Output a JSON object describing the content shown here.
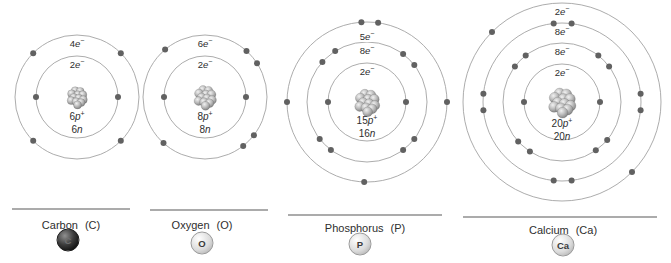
{
  "figure": {
    "colors": {
      "ring": "#a3a3a3",
      "electron": "#616161",
      "text": "#2e2e2e",
      "divider": "#8f8f8f",
      "badge_dark": "#141414",
      "badge_light": "#d9d9d9"
    },
    "atoms": [
      {
        "id": "carbon",
        "caption": {
          "name": "Carbon",
          "symbol": "(C)"
        },
        "badge": {
          "text": "C",
          "style": "dark"
        },
        "center": {
          "x": 77,
          "y": 97
        },
        "nucleus": {
          "protons": {
            "count": "6",
            "particle": "p",
            "charge": "+"
          },
          "neutrons": {
            "count": "6",
            "particle": "n"
          },
          "scale": 0.9,
          "label_y": 117
        },
        "shells": [
          {
            "radius": 41,
            "label": {
              "count": "2",
              "particle": "e",
              "charge": "−"
            },
            "label_dy": 9,
            "electron_angles": [
              180,
              0
            ]
          },
          {
            "radius": 62,
            "label": {
              "count": "4",
              "particle": "e",
              "charge": "−"
            },
            "label_dy": 9,
            "electron_angles": [
              135,
              45,
              225,
              315
            ]
          }
        ],
        "baseline": {
          "x1": 12,
          "x2": 130,
          "y": 209
        },
        "caption_pos": {
          "x": 71,
          "y": 225
        },
        "badge_pos": {
          "x": 68,
          "y": 240
        }
      },
      {
        "id": "oxygen",
        "caption": {
          "name": "Oxygen",
          "symbol": "(O)"
        },
        "badge": {
          "text": "O",
          "style": "light"
        },
        "center": {
          "x": 205,
          "y": 97
        },
        "nucleus": {
          "protons": {
            "count": "8",
            "particle": "p",
            "charge": "+"
          },
          "neutrons": {
            "count": "8",
            "particle": "n"
          },
          "scale": 1.0,
          "label_y": 117
        },
        "shells": [
          {
            "radius": 41,
            "label": {
              "count": "2",
              "particle": "e",
              "charge": "−"
            },
            "label_dy": 9,
            "electron_angles": [
              180,
              0
            ]
          },
          {
            "radius": 62,
            "label": {
              "count": "6",
              "particle": "e",
              "charge": "−"
            },
            "label_dy": 9,
            "electron_angles": [
              130,
              48,
              33,
              228,
              308,
              322
            ]
          }
        ],
        "baseline": {
          "x1": 150,
          "x2": 268,
          "y": 210
        },
        "caption_pos": {
          "x": 202,
          "y": 225
        },
        "badge_pos": {
          "x": 202,
          "y": 243
        }
      },
      {
        "id": "phosphorus",
        "caption": {
          "name": "Phosphorus",
          "symbol": "(P)"
        },
        "badge": {
          "text": "P",
          "style": "light"
        },
        "center": {
          "x": 367,
          "y": 102
        },
        "nucleus": {
          "protons": {
            "count": "15",
            "particle": "p",
            "charge": "+"
          },
          "neutrons": {
            "count": "16",
            "particle": "n"
          },
          "scale": 1.12,
          "label_y": 121
        },
        "shells": [
          {
            "radius": 39,
            "label": {
              "count": "2",
              "particle": "e",
              "charge": "−"
            },
            "label_dy": 9,
            "electron_angles": [
              180,
              0
            ]
          },
          {
            "radius": 60,
            "label": {
              "count": "8",
              "particle": "e",
              "charge": "−"
            },
            "label_dy": 9,
            "electron_angles": [
              138,
              122,
              53,
              38,
              218,
              233,
              307,
              322
            ]
          },
          {
            "radius": 80,
            "label": {
              "count": "5",
              "particle": "e",
              "charge": "−"
            },
            "label_dy": 15,
            "electron_angles": [
              94,
              82,
              180,
              0,
              268
            ]
          }
        ],
        "baseline": {
          "x1": 288,
          "x2": 442,
          "y": 215
        },
        "caption_pos": {
          "x": 365,
          "y": 228
        },
        "badge_pos": {
          "x": 360,
          "y": 244
        }
      },
      {
        "id": "calcium",
        "caption": {
          "name": "Calcium",
          "symbol": "(Ca)"
        },
        "badge": {
          "text": "Ca",
          "style": "light"
        },
        "center": {
          "x": 562,
          "y": 102
        },
        "nucleus": {
          "protons": {
            "count": "20",
            "particle": "p",
            "charge": "+"
          },
          "neutrons": {
            "count": "20",
            "particle": "n"
          },
          "scale": 1.22,
          "label_y": 124
        },
        "shells": [
          {
            "radius": 38,
            "label": {
              "count": "2",
              "particle": "e",
              "charge": "−"
            },
            "label_dy": 9,
            "electron_angles": [
              180,
              0
            ]
          },
          {
            "radius": 59,
            "label": {
              "count": "8",
              "particle": "e",
              "charge": "−"
            },
            "label_dy": 9,
            "electron_angles": [
              128,
              143,
              52,
              37,
              222,
              237,
              305,
              320
            ]
          },
          {
            "radius": 79,
            "label": {
              "count": "8",
              "particle": "e",
              "charge": "−"
            },
            "label_dy": 9,
            "electron_angles": [
              96,
              83,
              174,
              186,
              354,
              6,
              264,
              277
            ]
          },
          {
            "radius": 99,
            "label": {
              "count": "2",
              "particle": "e",
              "charge": "−"
            },
            "label_dy": 9,
            "electron_angles": [
              135,
              315
            ]
          }
        ],
        "baseline": {
          "x1": 463,
          "x2": 657,
          "y": 217
        },
        "caption_pos": {
          "x": 563,
          "y": 230
        },
        "badge_pos": {
          "x": 563,
          "y": 245
        }
      }
    ]
  }
}
